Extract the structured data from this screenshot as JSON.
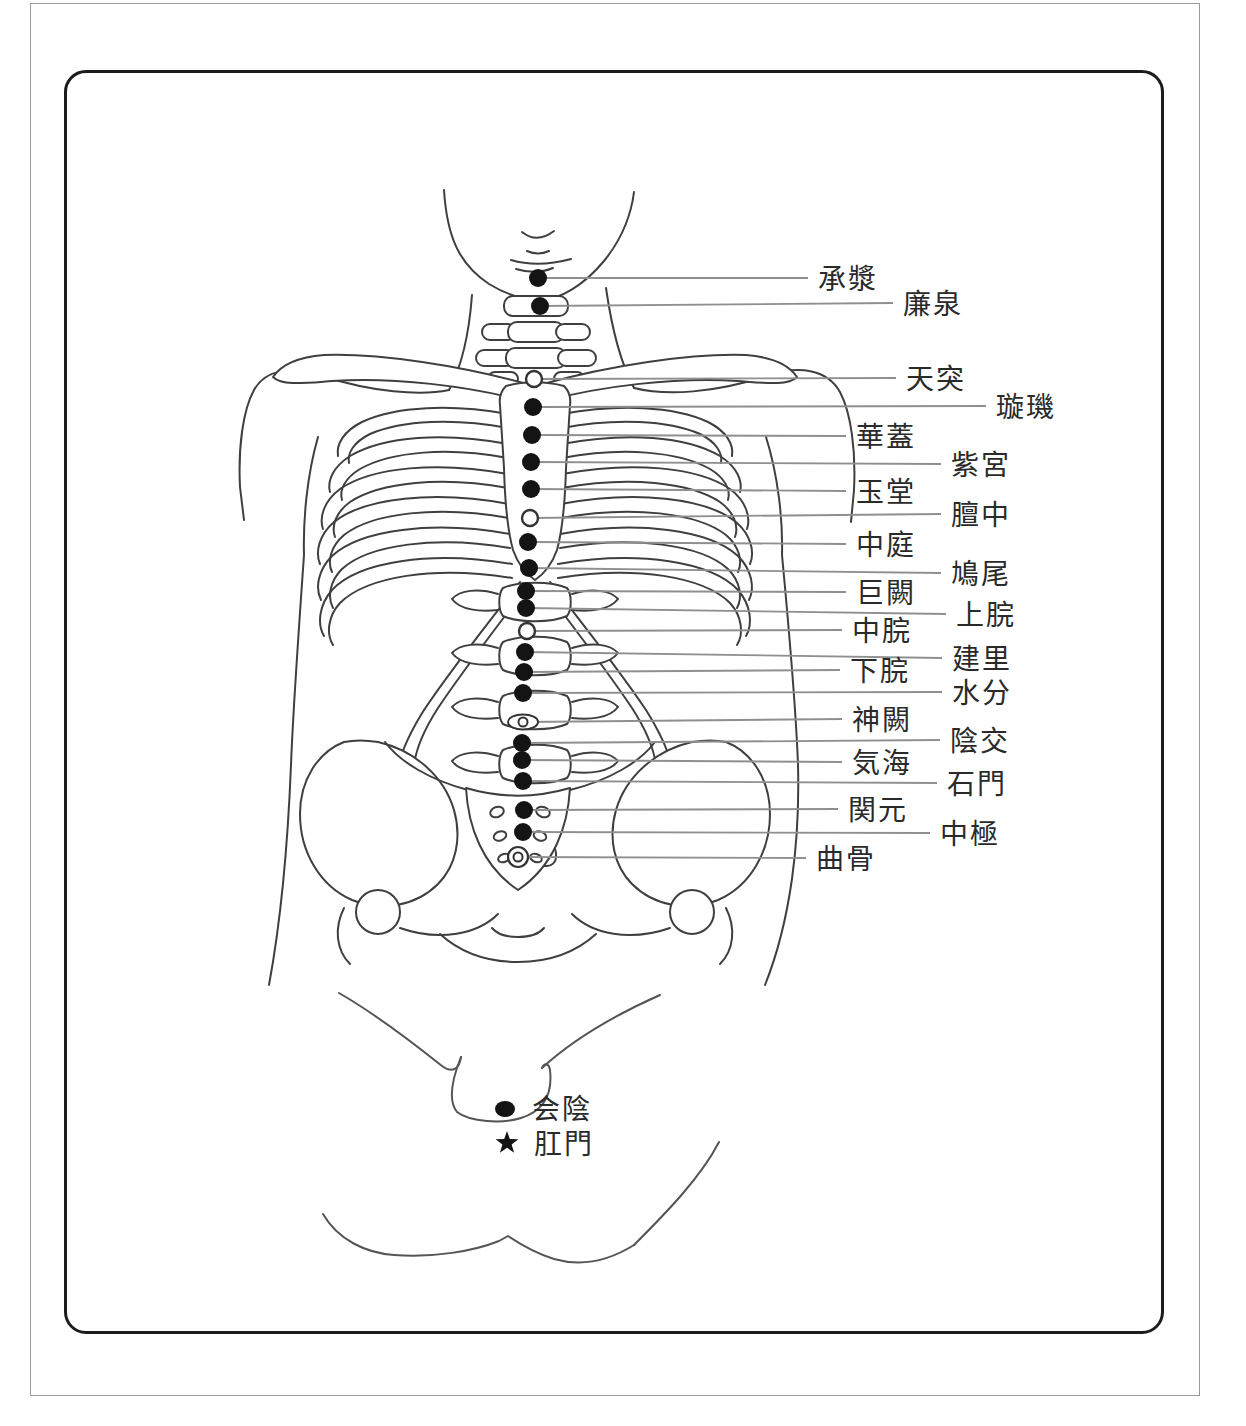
{
  "colors": {
    "line_art": "#3f3f3f",
    "leader_line": "#8f8f8f",
    "marker": "#141414",
    "marker_stroke": "#333333",
    "label_text": "#2a2a2a",
    "inner_border": "#1c1c1c",
    "outer_border": "#9a9a9a",
    "background": "#ffffff"
  },
  "diagram": {
    "points": [
      {
        "label": "承漿",
        "marker": "filled",
        "dot": {
          "x": 538,
          "y": 278
        },
        "line_end_x": 808,
        "label_x": 818,
        "label_y": 278
      },
      {
        "label": "廉泉",
        "marker": "filled",
        "dot": {
          "x": 540,
          "y": 306
        },
        "line_end_x": 893,
        "label_x": 903,
        "label_y": 303
      },
      {
        "label": "天突",
        "marker": "open",
        "dot": {
          "x": 534,
          "y": 379
        },
        "line_end_x": 896,
        "label_x": 906,
        "label_y": 378
      },
      {
        "label": "璇璣",
        "marker": "filled",
        "dot": {
          "x": 533,
          "y": 407
        },
        "line_end_x": 986,
        "label_x": 996,
        "label_y": 406
      },
      {
        "label": "華蓋",
        "marker": "filled",
        "dot": {
          "x": 532,
          "y": 435
        },
        "line_end_x": 846,
        "label_x": 856,
        "label_y": 436
      },
      {
        "label": "紫宮",
        "marker": "filled",
        "dot": {
          "x": 531,
          "y": 462
        },
        "line_end_x": 941,
        "label_x": 951,
        "label_y": 464
      },
      {
        "label": "玉堂",
        "marker": "filled",
        "dot": {
          "x": 531,
          "y": 489
        },
        "line_end_x": 846,
        "label_x": 856,
        "label_y": 491
      },
      {
        "label": "膻中",
        "marker": "open",
        "dot": {
          "x": 530,
          "y": 518
        },
        "line_end_x": 941,
        "label_x": 951,
        "label_y": 514
      },
      {
        "label": "中庭",
        "marker": "filled",
        "dot": {
          "x": 528,
          "y": 542
        },
        "line_end_x": 846,
        "label_x": 856,
        "label_y": 544
      },
      {
        "label": "鳩尾",
        "marker": "filled",
        "dot": {
          "x": 529,
          "y": 568
        },
        "line_end_x": 941,
        "label_x": 951,
        "label_y": 573
      },
      {
        "label": "巨闕",
        "marker": "filled",
        "dot": {
          "x": 526,
          "y": 591
        },
        "line_end_x": 846,
        "label_x": 856,
        "label_y": 592
      },
      {
        "label": "上脘",
        "marker": "filled",
        "dot": {
          "x": 526,
          "y": 608
        },
        "line_end_x": 946,
        "label_x": 956,
        "label_y": 614
      },
      {
        "label": "中脘",
        "marker": "open",
        "dot": {
          "x": 527,
          "y": 631
        },
        "line_end_x": 842,
        "label_x": 852,
        "label_y": 630
      },
      {
        "label": "建里",
        "marker": "filled",
        "dot": {
          "x": 525,
          "y": 652
        },
        "line_end_x": 942,
        "label_x": 952,
        "label_y": 658
      },
      {
        "label": "下脘",
        "marker": "filled",
        "dot": {
          "x": 524,
          "y": 672
        },
        "line_end_x": 840,
        "label_x": 850,
        "label_y": 670
      },
      {
        "label": "水分",
        "marker": "filled",
        "dot": {
          "x": 523,
          "y": 693
        },
        "line_end_x": 942,
        "label_x": 952,
        "label_y": 692
      },
      {
        "label": "神闕",
        "marker": "navel",
        "dot": {
          "x": 523,
          "y": 722
        },
        "line_end_x": 842,
        "label_x": 852,
        "label_y": 719
      },
      {
        "label": "陰交",
        "marker": "filled",
        "dot": {
          "x": 522,
          "y": 743
        },
        "line_end_x": 940,
        "label_x": 950,
        "label_y": 740
      },
      {
        "label": "気海",
        "marker": "filled",
        "dot": {
          "x": 522,
          "y": 760
        },
        "line_end_x": 842,
        "label_x": 852,
        "label_y": 762
      },
      {
        "label": "石門",
        "marker": "filled",
        "dot": {
          "x": 523,
          "y": 781
        },
        "line_end_x": 937,
        "label_x": 947,
        "label_y": 783
      },
      {
        "label": "関元",
        "marker": "filled",
        "dot": {
          "x": 524,
          "y": 810
        },
        "line_end_x": 838,
        "label_x": 848,
        "label_y": 809
      },
      {
        "label": "中極",
        "marker": "filled",
        "dot": {
          "x": 523,
          "y": 832
        },
        "line_end_x": 930,
        "label_x": 940,
        "label_y": 833
      },
      {
        "label": "曲骨",
        "marker": "ring",
        "dot": {
          "x": 518,
          "y": 857
        },
        "line_end_x": 806,
        "label_x": 816,
        "label_y": 858
      }
    ],
    "legend": [
      {
        "label": "会陰",
        "marker": "dot",
        "marker_x": 505,
        "marker_y": 1109,
        "label_x": 532,
        "label_y": 1108
      },
      {
        "label": "肛門",
        "marker": "star",
        "marker_x": 507,
        "marker_y": 1143,
        "label_x": 534,
        "label_y": 1143
      }
    ]
  }
}
